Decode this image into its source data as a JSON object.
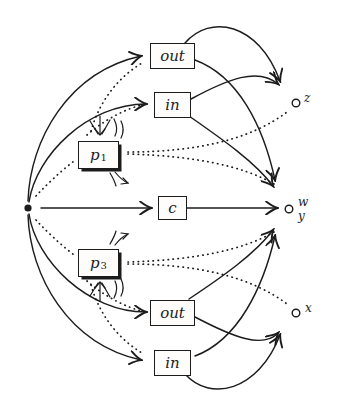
{
  "diagram": {
    "ink_color": "#1c1c1c",
    "background_color": "#ffffff",
    "start_dot": {
      "name": "start"
    },
    "boxes": [
      {
        "id": "out-top",
        "label": "out",
        "sub": "",
        "shadow": false
      },
      {
        "id": "in-top",
        "label": "in",
        "sub": "",
        "shadow": false
      },
      {
        "id": "p1",
        "label": "p",
        "sub": "1",
        "shadow": true
      },
      {
        "id": "c",
        "label": "c",
        "sub": "",
        "shadow": false
      },
      {
        "id": "p3",
        "label": "p",
        "sub": "3",
        "shadow": true
      },
      {
        "id": "out-bottom",
        "label": "out",
        "sub": "",
        "shadow": false
      },
      {
        "id": "in-bottom",
        "label": "in",
        "sub": "",
        "shadow": false
      }
    ],
    "places": {
      "z": "z",
      "w": "w",
      "y": "y",
      "x": "x"
    },
    "edges": [
      {
        "from": "start",
        "to": "out-top",
        "style": "solid"
      },
      {
        "from": "start",
        "to": "in-top",
        "style": "solid"
      },
      {
        "from": "start",
        "to": "c",
        "style": "solid"
      },
      {
        "from": "start",
        "to": "out-bottom",
        "style": "solid"
      },
      {
        "from": "start",
        "to": "in-bottom",
        "style": "solid"
      },
      {
        "from": "c",
        "to": "w",
        "style": "solid"
      },
      {
        "from": "out-top",
        "to": "z",
        "style": "solid"
      },
      {
        "from": "out-top",
        "to": "w",
        "style": "solid"
      },
      {
        "from": "in-top",
        "to": "z",
        "style": "solid"
      },
      {
        "from": "in-top",
        "to": "w",
        "style": "solid"
      },
      {
        "from": "out-bottom",
        "to": "w",
        "style": "solid"
      },
      {
        "from": "out-bottom",
        "to": "x",
        "style": "solid"
      },
      {
        "from": "in-bottom",
        "to": "w",
        "style": "solid"
      },
      {
        "from": "in-bottom",
        "to": "x",
        "style": "solid"
      },
      {
        "from": "start",
        "to": "p1",
        "style": "dotted"
      },
      {
        "from": "p1",
        "to": "in-top",
        "style": "dotted"
      },
      {
        "from": "p1",
        "to": "out-top",
        "style": "dotted"
      },
      {
        "from": "p1",
        "to": "z",
        "style": "dotted"
      },
      {
        "from": "p1",
        "to": "w",
        "style": "dotted"
      },
      {
        "from": "start",
        "to": "p3",
        "style": "dotted"
      },
      {
        "from": "p3",
        "to": "out-bottom",
        "style": "dotted"
      },
      {
        "from": "p3",
        "to": "in-bottom",
        "style": "dotted"
      },
      {
        "from": "p3",
        "to": "x",
        "style": "dotted"
      },
      {
        "from": "p3",
        "to": "w",
        "style": "dotted"
      }
    ]
  }
}
